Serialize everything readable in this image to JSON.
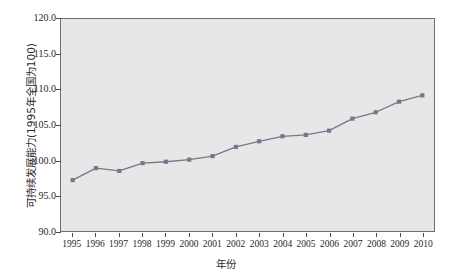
{
  "chart_data": {
    "type": "line",
    "title": "",
    "subtitle": "",
    "xlabel": "年份",
    "ylabel": "可持续发展能力(1995年全国为100)",
    "x": [
      1995,
      1996,
      1997,
      1998,
      1999,
      2000,
      2001,
      2002,
      2003,
      2004,
      2005,
      2006,
      2007,
      2008,
      2009,
      2010
    ],
    "categories": [
      "1995",
      "1996",
      "1997",
      "1998",
      "1999",
      "2000",
      "2001",
      "2002",
      "2003",
      "2004",
      "2005",
      "2006",
      "2007",
      "2008",
      "2009",
      "2010"
    ],
    "values": [
      97.2,
      98.9,
      98.5,
      99.6,
      99.8,
      100.1,
      100.6,
      101.9,
      102.7,
      103.4,
      103.6,
      104.2,
      105.9,
      106.8,
      108.3,
      109.2
    ],
    "series": [
      {
        "name": "可持续发展能力",
        "values": [
          97.2,
          98.9,
          98.5,
          99.6,
          99.8,
          100.1,
          100.6,
          101.9,
          102.7,
          103.4,
          103.6,
          104.2,
          105.9,
          106.8,
          108.3,
          109.2
        ],
        "color": "#77778c",
        "marker": "square",
        "line_style": "solid"
      }
    ],
    "ylim": [
      90.0,
      120.0
    ],
    "xlim": [
      1994.5,
      2010.5
    ],
    "yticks": [
      90.0,
      95.0,
      100.0,
      105.0,
      110.0,
      115.0,
      120.0
    ],
    "ytick_labels": [
      "90.0",
      "95.0",
      "100.0",
      "105.0",
      "110.0",
      "115.0",
      "120.0"
    ],
    "xtick_labels": [
      "1995",
      "1996",
      "1997",
      "1998",
      "1999",
      "2000",
      "2001",
      "2002",
      "2003",
      "2004",
      "2005",
      "2006",
      "2007",
      "2008",
      "2009",
      "2010"
    ],
    "grid": false,
    "legend": false,
    "legend_position": "none",
    "plot_background": "#e7e7e7",
    "figure_background": "#ffffff",
    "axis_color": "#6f6f6f",
    "annotations": []
  }
}
